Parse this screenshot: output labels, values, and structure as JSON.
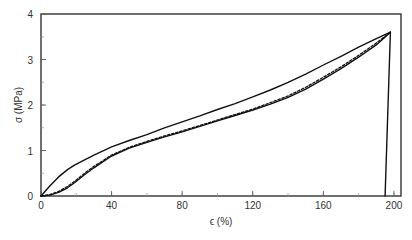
{
  "chart_data": {
    "type": "line",
    "title": "",
    "xlabel": "ϵ (%)",
    "ylabel": "σ (MPa)",
    "xlim": [
      0,
      204
    ],
    "ylim": [
      0,
      4
    ],
    "xticks": [
      0,
      40,
      80,
      120,
      160,
      200
    ],
    "yticks": [
      0,
      1,
      2,
      3,
      4
    ],
    "x_minor_step": 20,
    "y_minor_step": 0.5,
    "grid": false,
    "legend": "none",
    "series": [
      {
        "name": "cycle 1 loading",
        "style": "solid",
        "x": [
          0,
          5,
          10,
          15,
          19,
          25,
          30,
          40,
          50,
          60,
          70,
          80,
          90,
          100,
          110,
          120,
          130,
          140,
          150,
          160,
          170,
          180,
          190,
          198
        ],
        "y": [
          0,
          0.22,
          0.42,
          0.58,
          0.68,
          0.8,
          0.9,
          1.08,
          1.22,
          1.35,
          1.5,
          1.63,
          1.76,
          1.9,
          2.03,
          2.18,
          2.33,
          2.5,
          2.68,
          2.88,
          3.07,
          3.27,
          3.46,
          3.6
        ]
      },
      {
        "name": "cycle 2 loading",
        "style": "solid",
        "x": [
          0,
          5,
          10,
          15,
          19,
          25,
          30,
          40,
          50,
          60,
          70,
          80,
          90,
          100,
          110,
          120,
          130,
          140,
          150,
          160,
          170,
          180,
          190,
          198
        ],
        "y": [
          0,
          0.02,
          0.08,
          0.18,
          0.29,
          0.48,
          0.62,
          0.88,
          1.05,
          1.18,
          1.3,
          1.41,
          1.53,
          1.65,
          1.77,
          1.89,
          2.02,
          2.17,
          2.35,
          2.57,
          2.8,
          3.05,
          3.32,
          3.6
        ]
      },
      {
        "name": "cycle 3 loading",
        "style": "dashed",
        "x": [
          0,
          5,
          10,
          15,
          19,
          25,
          30,
          40,
          50,
          60,
          70,
          80,
          90,
          100,
          110,
          120,
          130,
          140,
          150,
          160,
          170,
          180,
          190,
          198
        ],
        "y": [
          0,
          0.03,
          0.1,
          0.21,
          0.32,
          0.51,
          0.65,
          0.9,
          1.07,
          1.2,
          1.32,
          1.43,
          1.55,
          1.67,
          1.79,
          1.91,
          2.05,
          2.2,
          2.39,
          2.61,
          2.84,
          3.09,
          3.36,
          3.6
        ]
      },
      {
        "name": "unloading",
        "style": "solid",
        "x": [
          198,
          195
        ],
        "y": [
          3.6,
          0
        ]
      }
    ]
  }
}
